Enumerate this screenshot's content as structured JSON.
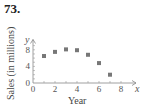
{
  "problem_number": "73.",
  "chart_data": {
    "type": "scatter",
    "title": "",
    "xlabel": "Year",
    "ylabel": "Sales (in millions)",
    "x_axis_var": "x",
    "y_axis_var": "y",
    "x": [
      1,
      2,
      3,
      4,
      5,
      6,
      7
    ],
    "y": [
      6.5,
      7.5,
      8.1,
      7.9,
      6.8,
      4.8,
      2.0
    ],
    "x_ticks": [
      0,
      2,
      4,
      6,
      8
    ],
    "y_ticks": [
      0,
      4,
      8
    ],
    "xlim": [
      0,
      9
    ],
    "ylim": [
      0,
      10
    ],
    "grid": false,
    "legend": null,
    "marker_color": "#777777"
  }
}
